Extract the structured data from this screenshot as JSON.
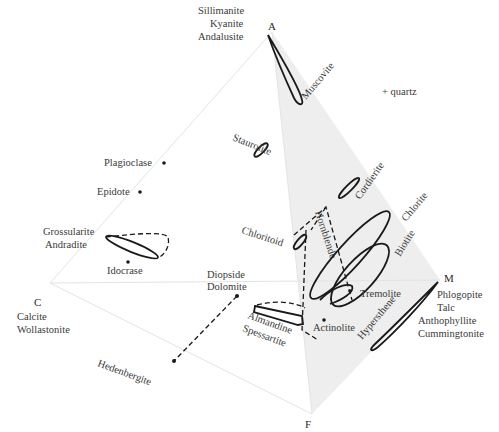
{
  "diagram": {
    "note": "+ quartz",
    "colors": {
      "face_shade": "#ececec",
      "edge_line": "#e4e4e4",
      "outline": "#1a1a1a",
      "text": "#3a3a3a"
    },
    "vertices": {
      "A": {
        "label": "A",
        "minerals": [
          "Sillimanite",
          "Kyanite",
          "Andalusite"
        ]
      },
      "C": {
        "label": "C",
        "minerals": [
          "Calcite",
          "Wollastonite"
        ]
      },
      "F": {
        "label": "F",
        "minerals": []
      },
      "M": {
        "label": "M",
        "minerals": [
          "Phlogopite",
          "Talc",
          "Anthophyllite",
          "Cummingtonite"
        ]
      }
    },
    "minerals": {
      "muscovite": "Muscovite",
      "staurolite": "Staurolite",
      "cordierite": "Cordierite",
      "chlorite": "Chlorite",
      "biotite": "Biotite",
      "chloritoid": "Chloritoid",
      "hornblende": "Hornblende",
      "tremolite": "Tremolite",
      "actinolite": "Actinolite",
      "hypersthene": "Hypersthene",
      "plagioclase": "Plagioclase",
      "epidote": "Epidote",
      "grossularite": "Grossularite",
      "andradite": "Andradite",
      "idocrase": "Idocrase",
      "diopside": "Diopside",
      "dolomite": "Dolomite",
      "hedenbergite": "Hedenbergite",
      "almandine": "Almandine",
      "spessartite": "Spessartite"
    }
  }
}
